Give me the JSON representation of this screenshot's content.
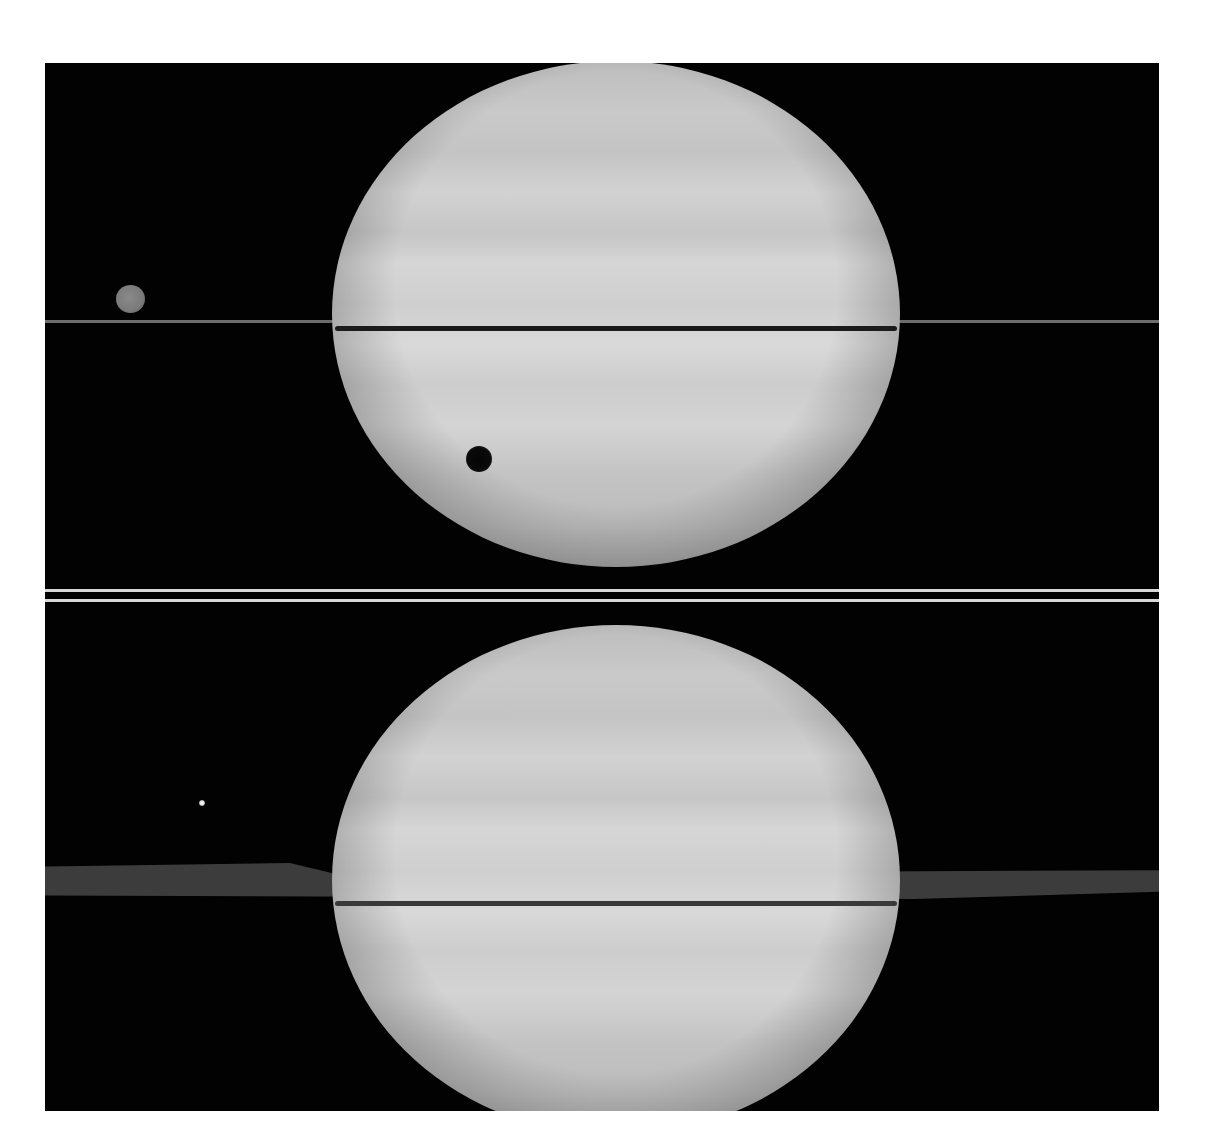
{
  "image": {
    "description": "Two stacked grayscale telescope images of Saturn with its rings seen nearly edge-on",
    "background_color": "#ffffff",
    "figure_background": "#000000",
    "separator_color": "#d8d8d8"
  },
  "panels": [
    {
      "position": "top",
      "subject": "Saturn with rings edge-on as a thin line",
      "features": [
        {
          "type": "planet",
          "shade": "#c8c8c8"
        },
        {
          "type": "ring-line",
          "shade": "#6d6d6d"
        },
        {
          "type": "moon-disk",
          "location": "left of planet",
          "shade": "#808080"
        },
        {
          "type": "moon-shadow",
          "location": "on lower-left of planet disk",
          "shade": "#050505"
        }
      ]
    },
    {
      "position": "bottom",
      "subject": "Saturn with rings slightly open, showing ring plane",
      "features": [
        {
          "type": "planet",
          "shade": "#cdcdcd"
        },
        {
          "type": "ring-plane",
          "shade": "#3f3f3f"
        },
        {
          "type": "moon-point",
          "location": "upper left",
          "shade": "#ffffff"
        }
      ]
    }
  ]
}
